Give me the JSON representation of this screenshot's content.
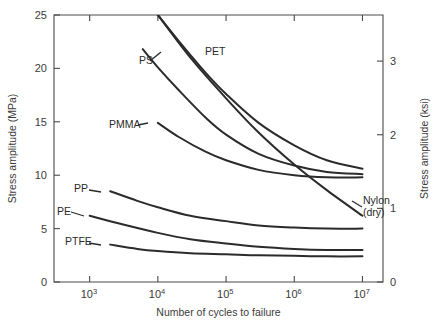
{
  "chart_data": {
    "type": "line",
    "title": "",
    "xlabel": "Number of cycles to failure",
    "ylabel": "Stress amplitude (MPa)",
    "y2label": "Stress amplitude (ksi)",
    "xscale": "log",
    "xlim": [
      300,
      20000000
    ],
    "ylim": [
      0,
      25
    ],
    "y2lim": [
      0,
      3.626
    ],
    "grid": false,
    "legend_position": "inline-labels",
    "xticks": [
      {
        "value": 1000,
        "label": "10",
        "exponent": "3"
      },
      {
        "value": 10000,
        "label": "10",
        "exponent": "4"
      },
      {
        "value": 100000,
        "label": "10",
        "exponent": "5"
      },
      {
        "value": 1000000,
        "label": "10",
        "exponent": "6"
      },
      {
        "value": 10000000,
        "label": "10",
        "exponent": "7"
      }
    ],
    "yticks": [
      {
        "value": 0,
        "label": "0"
      },
      {
        "value": 5,
        "label": "5"
      },
      {
        "value": 10,
        "label": "10"
      },
      {
        "value": 15,
        "label": "15"
      },
      {
        "value": 20,
        "label": "20"
      },
      {
        "value": 25,
        "label": "25"
      }
    ],
    "y2ticks": [
      {
        "value": 0,
        "label": "0"
      },
      {
        "value": 1,
        "label": "1"
      },
      {
        "value": 2,
        "label": "2"
      },
      {
        "value": 3,
        "label": "3"
      }
    ],
    "series": [
      {
        "name": "PET",
        "label": "PET",
        "label_x": 205,
        "label_y": 55,
        "color": "#2b2b2b",
        "points": [
          [
            10000,
            25.0
          ],
          [
            20000,
            22.6
          ],
          [
            50000,
            19.6
          ],
          [
            100000,
            17.6
          ],
          [
            300000,
            14.9
          ],
          [
            1000000,
            12.8
          ],
          [
            3000000,
            11.4
          ],
          [
            10000000,
            10.6
          ]
        ]
      },
      {
        "name": "PS",
        "label": "PS",
        "label_x": 139,
        "label_y": 64,
        "color": "#2b2b2b",
        "points": [
          [
            6000,
            21.8
          ],
          [
            10000,
            20.1
          ],
          [
            20000,
            18.0
          ],
          [
            50000,
            15.4
          ],
          [
            100000,
            13.8
          ],
          [
            300000,
            12.0
          ],
          [
            1000000,
            10.9
          ],
          [
            3000000,
            10.3
          ],
          [
            10000000,
            10.1
          ]
        ]
      },
      {
        "name": "PMMA",
        "label": "PMMA",
        "label_x": 109,
        "label_y": 128,
        "color": "#2b2b2b",
        "points": [
          [
            10000,
            14.9
          ],
          [
            20000,
            13.6
          ],
          [
            50000,
            12.2
          ],
          [
            100000,
            11.4
          ],
          [
            300000,
            10.5
          ],
          [
            1000000,
            10.0
          ],
          [
            3000000,
            9.8
          ],
          [
            10000000,
            9.8
          ]
        ]
      },
      {
        "name": "Nylon (dry)",
        "label": "Nylon",
        "label2": "(dry)",
        "label_x": 363,
        "label_y": 204,
        "color": "#2b2b2b",
        "points": [
          [
            10000,
            25.0
          ],
          [
            30000,
            21.0
          ],
          [
            100000,
            17.2
          ],
          [
            300000,
            14.0
          ],
          [
            1000000,
            11.0
          ],
          [
            3000000,
            8.6
          ],
          [
            10000000,
            6.2
          ]
        ]
      },
      {
        "name": "PP",
        "label": "PP",
        "label_x": 74,
        "label_y": 192,
        "color": "#2b2b2b",
        "points": [
          [
            2000,
            8.5
          ],
          [
            5000,
            7.6
          ],
          [
            10000,
            7.0
          ],
          [
            30000,
            6.2
          ],
          [
            100000,
            5.7
          ],
          [
            300000,
            5.3
          ],
          [
            1000000,
            5.1
          ],
          [
            3000000,
            5.0
          ],
          [
            10000000,
            5.0
          ]
        ]
      },
      {
        "name": "PE",
        "label": "PE",
        "label_x": 57,
        "label_y": 215,
        "color": "#2b2b2b",
        "points": [
          [
            1000,
            6.2
          ],
          [
            3000,
            5.4
          ],
          [
            10000,
            4.6
          ],
          [
            30000,
            4.0
          ],
          [
            100000,
            3.6
          ],
          [
            300000,
            3.3
          ],
          [
            1000000,
            3.1
          ],
          [
            3000000,
            3.0
          ],
          [
            10000000,
            3.0
          ]
        ]
      },
      {
        "name": "PTFE",
        "label": "PTFE",
        "label_x": 65,
        "label_y": 245,
        "color": "#2b2b2b",
        "points": [
          [
            2000,
            3.5
          ],
          [
            5000,
            3.1
          ],
          [
            10000,
            2.9
          ],
          [
            30000,
            2.7
          ],
          [
            100000,
            2.6
          ],
          [
            300000,
            2.5
          ],
          [
            1000000,
            2.45
          ],
          [
            3000000,
            2.4
          ],
          [
            10000000,
            2.4
          ]
        ]
      }
    ],
    "label_leaders": [
      {
        "name": "ps-leader",
        "x1": 150,
        "y1": 61,
        "x2": 161,
        "y2": 52
      },
      {
        "name": "pmma-leader",
        "x1": 138,
        "y1": 125,
        "x2": 148,
        "y2": 123
      },
      {
        "name": "pp-leader",
        "x1": 89,
        "y1": 190,
        "x2": 101,
        "y2": 192
      },
      {
        "name": "pe-leader",
        "x1": 71,
        "y1": 212,
        "x2": 84,
        "y2": 216
      },
      {
        "name": "ptfe-leader",
        "x1": 89,
        "y1": 243,
        "x2": 101,
        "y2": 245
      },
      {
        "name": "nylon-leader",
        "x1": 362,
        "y1": 207,
        "x2": 352,
        "y2": 201
      }
    ]
  }
}
